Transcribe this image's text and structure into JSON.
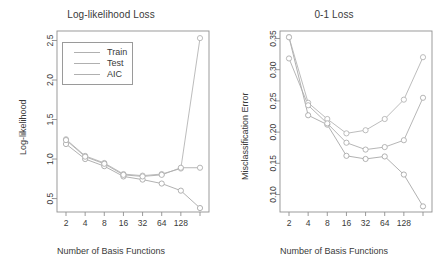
{
  "figure": {
    "background": "#ffffff",
    "panels": [
      "loglik",
      "zeroone"
    ]
  },
  "chart_data": [
    {
      "type": "line",
      "title": "Log-likelihood Loss",
      "xlabel": "Number of Basis Functions",
      "ylabel": "Log-likelihood",
      "x": [
        2,
        4,
        8,
        16,
        32,
        64,
        128,
        256
      ],
      "xtick_labels": [
        "2",
        "4",
        "8",
        "16",
        "32",
        "64",
        "128",
        ""
      ],
      "ytick_labels": [
        "0.5",
        "1.0",
        "1.5",
        "2.0",
        "2.5"
      ],
      "ytick_values": [
        0.5,
        1.0,
        1.5,
        2.0,
        2.5
      ],
      "ylim": [
        0.33,
        2.62
      ],
      "grid": false,
      "legend_position": "top-left",
      "legend_entries": [
        "Train",
        "Test",
        "AIC"
      ],
      "marker": "open-circle",
      "series": [
        {
          "name": "Train",
          "color": "#a8a8a8",
          "values": [
            1.19,
            1.0,
            0.91,
            0.78,
            0.74,
            0.69,
            0.6,
            0.38
          ]
        },
        {
          "name": "Test",
          "color": "#b4b4b4",
          "values": [
            1.25,
            1.04,
            0.95,
            0.81,
            0.79,
            0.81,
            0.88,
            2.53
          ]
        },
        {
          "name": "AIC",
          "color": "#aeaeae",
          "values": [
            1.24,
            1.03,
            0.94,
            0.8,
            0.78,
            0.8,
            0.89,
            0.89
          ]
        }
      ]
    },
    {
      "type": "line",
      "title": "0-1 Loss",
      "xlabel": "Number of Basis Functions",
      "ylabel": "Misclassification Error",
      "x": [
        2,
        4,
        8,
        16,
        32,
        64,
        128,
        256
      ],
      "xtick_labels": [
        "2",
        "4",
        "8",
        "16",
        "32",
        "64",
        "128",
        ""
      ],
      "ytick_labels": [
        "0.10",
        "0.15",
        "0.20",
        "0.25",
        "0.30",
        "0.35"
      ],
      "ytick_values": [
        0.1,
        0.15,
        0.2,
        0.25,
        0.3,
        0.35
      ],
      "ylim": [
        0.072,
        0.362
      ],
      "grid": false,
      "legend_position": "none",
      "marker": "open-circle",
      "series": [
        {
          "name": "Train",
          "color": "#a8a8a8",
          "values": [
            0.352,
            0.227,
            0.212,
            0.162,
            0.157,
            0.161,
            0.132,
            0.081
          ]
        },
        {
          "name": "Test",
          "color": "#b4b4b4",
          "values": [
            0.352,
            0.247,
            0.221,
            0.198,
            0.203,
            0.221,
            0.252,
            0.32
          ]
        },
        {
          "name": "AIC",
          "color": "#aeaeae",
          "values": [
            0.318,
            0.243,
            0.214,
            0.183,
            0.172,
            0.176,
            0.187,
            0.255
          ]
        }
      ]
    }
  ]
}
